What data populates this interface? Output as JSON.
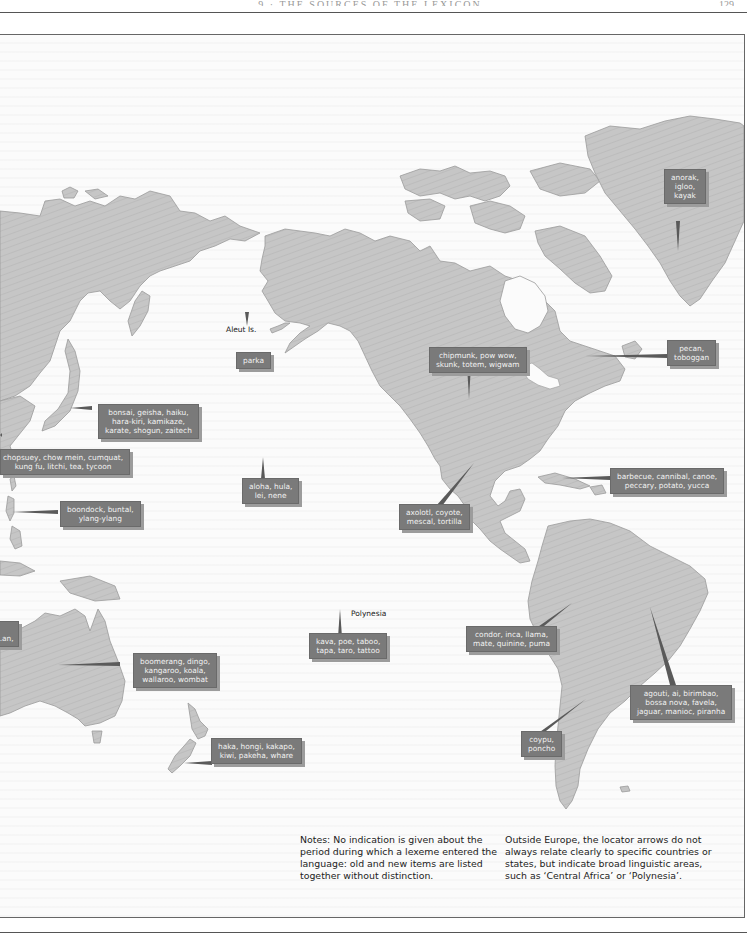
{
  "header": {
    "running_title": "9 · THE SOURCES OF THE LEXICON",
    "page_number": "129"
  },
  "map": {
    "colors": {
      "land": "#c4c4c4",
      "label_box": "#7a7a7a",
      "label_text": "#f2f2f2",
      "ocean": "#fbfbfb"
    },
    "place_labels": {
      "aleut": "Aleut Is.",
      "hawaii": "Hawaii",
      "polynesia": "Polynesia"
    },
    "callouts": {
      "greenland": [
        "anorak,",
        "igloo,",
        "kayak"
      ],
      "aleut": [
        "parka"
      ],
      "northeast_na": [
        "pecan,",
        "toboggan"
      ],
      "north_america": [
        "chipmunk, pow wow,",
        "skunk, totem, wigwam"
      ],
      "japan": [
        "bonsai, geisha, haiku,",
        "hara-kiri, kamikaze,",
        "karate, shogun, zaitech"
      ],
      "china": [
        "chopsuey, chow mein, cumquat,",
        "kung fu, litchi, tea, tycoon"
      ],
      "philippines": [
        "boondock, buntal,",
        "ylang-ylang"
      ],
      "hawaii": [
        "aloha, hula,",
        "lei, nene"
      ],
      "mexico": [
        "axolotl, coyote,",
        "mescal, tortilla"
      ],
      "caribbean": [
        "barbecue, cannibal, canoe,",
        "peccary, potato, yucca"
      ],
      "polynesia": [
        "kava, poe, taboo,",
        "tapa, taro, tattoo"
      ],
      "andes": [
        "condor, inca, llama,",
        "mate, quinine, puma"
      ],
      "brazil": [
        "agouti, ai, birimbao,",
        "bossa nova, favela,",
        "jaguar, manioc, piranha"
      ],
      "australia": [
        "boomerang, dingo,",
        "kangaroo, koala,",
        "wallaroo, wombat"
      ],
      "southern_cone": [
        "coypu,",
        "poncho"
      ],
      "new_zealand": [
        "haka, hongi, kakapo,",
        "kiwi, pakeha, whare"
      ],
      "cutoff_west": [
        "...",
        "...an,"
      ]
    }
  },
  "notes": {
    "left": [
      "Notes: No indication is given about the",
      "period during which a lexeme entered the",
      "language: old and new items are listed",
      "together without distinction."
    ],
    "right": [
      "Outside Europe, the locator arrows do not",
      "always relate clearly to specific countries or",
      "states, but indicate broad linguistic areas,",
      "such as ‘Central Africa’ or ‘Polynesia’."
    ]
  }
}
